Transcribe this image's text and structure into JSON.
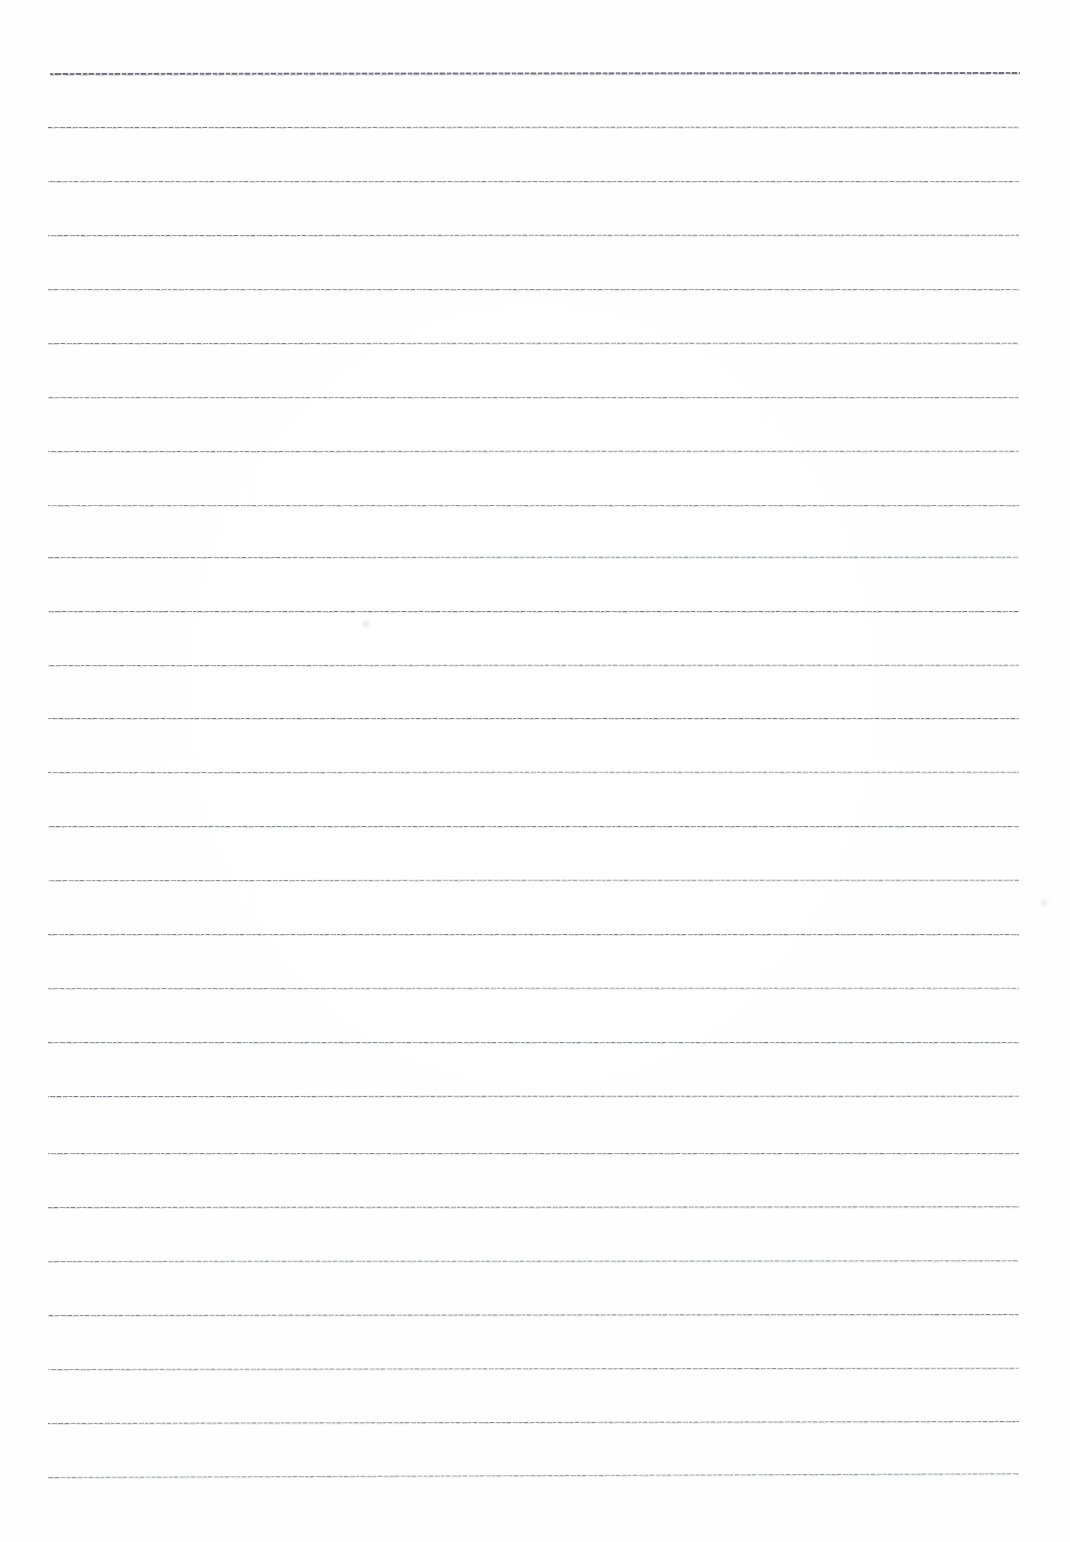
{
  "document": {
    "kind": "scanned-ruled-paper",
    "title": "Blank Lined Paper (scan)",
    "page_width": 1070,
    "page_height": 1542,
    "background_color": "#fefefe",
    "content_text": "",
    "handwriting_text": "",
    "printed_text": ""
  },
  "ruling": {
    "line_color": "#787c84",
    "faint_line_color": "#bcc0c6",
    "line_count": 27,
    "line_spacing_px": 54,
    "first_line_y": 73,
    "last_line_y": 1477,
    "left_margin_x": 50,
    "right_margin_x": 1019,
    "line_length_px": 969,
    "top_margin_px": 73,
    "bottom_margin_px": 65,
    "stroke_weight_px": 1,
    "lines": [
      {
        "index": 1,
        "y": 73,
        "x_start": 50,
        "x_end": 1020,
        "weight": "heavy",
        "tilt_deg": 0.06
      },
      {
        "index": 2,
        "y": 127,
        "x_start": 48,
        "x_end": 1019,
        "weight": "normal",
        "tilt_deg": 0.02
      },
      {
        "index": 3,
        "y": 181,
        "x_start": 48,
        "x_end": 1019,
        "weight": "normal",
        "tilt_deg": 0.0
      },
      {
        "index": 4,
        "y": 235,
        "x_start": 48,
        "x_end": 1019,
        "weight": "normal",
        "tilt_deg": 0.02
      },
      {
        "index": 5,
        "y": 289,
        "x_start": 48,
        "x_end": 1019,
        "weight": "normal",
        "tilt_deg": 0.0
      },
      {
        "index": 6,
        "y": 343,
        "x_start": 48,
        "x_end": 1019,
        "weight": "normal",
        "tilt_deg": 0.02
      },
      {
        "index": 7,
        "y": 397,
        "x_start": 48,
        "x_end": 1019,
        "weight": "normal",
        "tilt_deg": 0.0
      },
      {
        "index": 8,
        "y": 451,
        "x_start": 48,
        "x_end": 1019,
        "weight": "normal",
        "tilt_deg": 0.02
      },
      {
        "index": 9,
        "y": 505,
        "x_start": 48,
        "x_end": 1019,
        "weight": "normal",
        "tilt_deg": 0.0
      },
      {
        "index": 10,
        "y": 557,
        "x_start": 48,
        "x_end": 1019,
        "weight": "normal",
        "tilt_deg": 0.02
      },
      {
        "index": 11,
        "y": 611,
        "x_start": 48,
        "x_end": 1019,
        "weight": "normal",
        "tilt_deg": 0.0
      },
      {
        "index": 12,
        "y": 665,
        "x_start": 48,
        "x_end": 1019,
        "weight": "normal",
        "tilt_deg": 0.02
      },
      {
        "index": 13,
        "y": 718,
        "x_start": 48,
        "x_end": 1019,
        "weight": "normal",
        "tilt_deg": 0.0
      },
      {
        "index": 14,
        "y": 772,
        "x_start": 48,
        "x_end": 1019,
        "weight": "normal",
        "tilt_deg": 0.02
      },
      {
        "index": 15,
        "y": 826,
        "x_start": 48,
        "x_end": 1019,
        "weight": "normal",
        "tilt_deg": 0.0
      },
      {
        "index": 16,
        "y": 880,
        "x_start": 48,
        "x_end": 1019,
        "weight": "normal",
        "tilt_deg": 0.02
      },
      {
        "index": 17,
        "y": 934,
        "x_start": 48,
        "x_end": 1019,
        "weight": "normal",
        "tilt_deg": 0.0
      },
      {
        "index": 18,
        "y": 988,
        "x_start": 48,
        "x_end": 1019,
        "weight": "normal",
        "tilt_deg": 0.02
      },
      {
        "index": 19,
        "y": 1042,
        "x_start": 48,
        "x_end": 1019,
        "weight": "normal",
        "tilt_deg": 0.0
      },
      {
        "index": 20,
        "y": 1096,
        "x_start": 48,
        "x_end": 1019,
        "weight": "normal",
        "tilt_deg": 0.02
      },
      {
        "index": 21,
        "y": 1153,
        "x_start": 48,
        "x_end": 1019,
        "weight": "normal",
        "tilt_deg": 0.0
      },
      {
        "index": 22,
        "y": 1207,
        "x_start": 48,
        "x_end": 1019,
        "weight": "normal",
        "tilt_deg": 0.04
      },
      {
        "index": 23,
        "y": 1261,
        "x_start": 48,
        "x_end": 1019,
        "weight": "normal",
        "tilt_deg": 0.04
      },
      {
        "index": 24,
        "y": 1315,
        "x_start": 48,
        "x_end": 1019,
        "weight": "normal",
        "tilt_deg": 0.06
      },
      {
        "index": 25,
        "y": 1369,
        "x_start": 48,
        "x_end": 1019,
        "weight": "normal",
        "tilt_deg": 0.08
      },
      {
        "index": 26,
        "y": 1423,
        "x_start": 48,
        "x_end": 1019,
        "weight": "normal",
        "tilt_deg": 0.12
      },
      {
        "index": 27,
        "y": 1477,
        "x_start": 48,
        "x_end": 1019,
        "weight": "normal",
        "tilt_deg": 0.22
      }
    ]
  },
  "blemishes": [
    {
      "id": "blemish-center",
      "x": 366,
      "y": 624,
      "size": 10
    },
    {
      "id": "blemish-right",
      "x": 1044,
      "y": 903,
      "size": 12
    }
  ]
}
